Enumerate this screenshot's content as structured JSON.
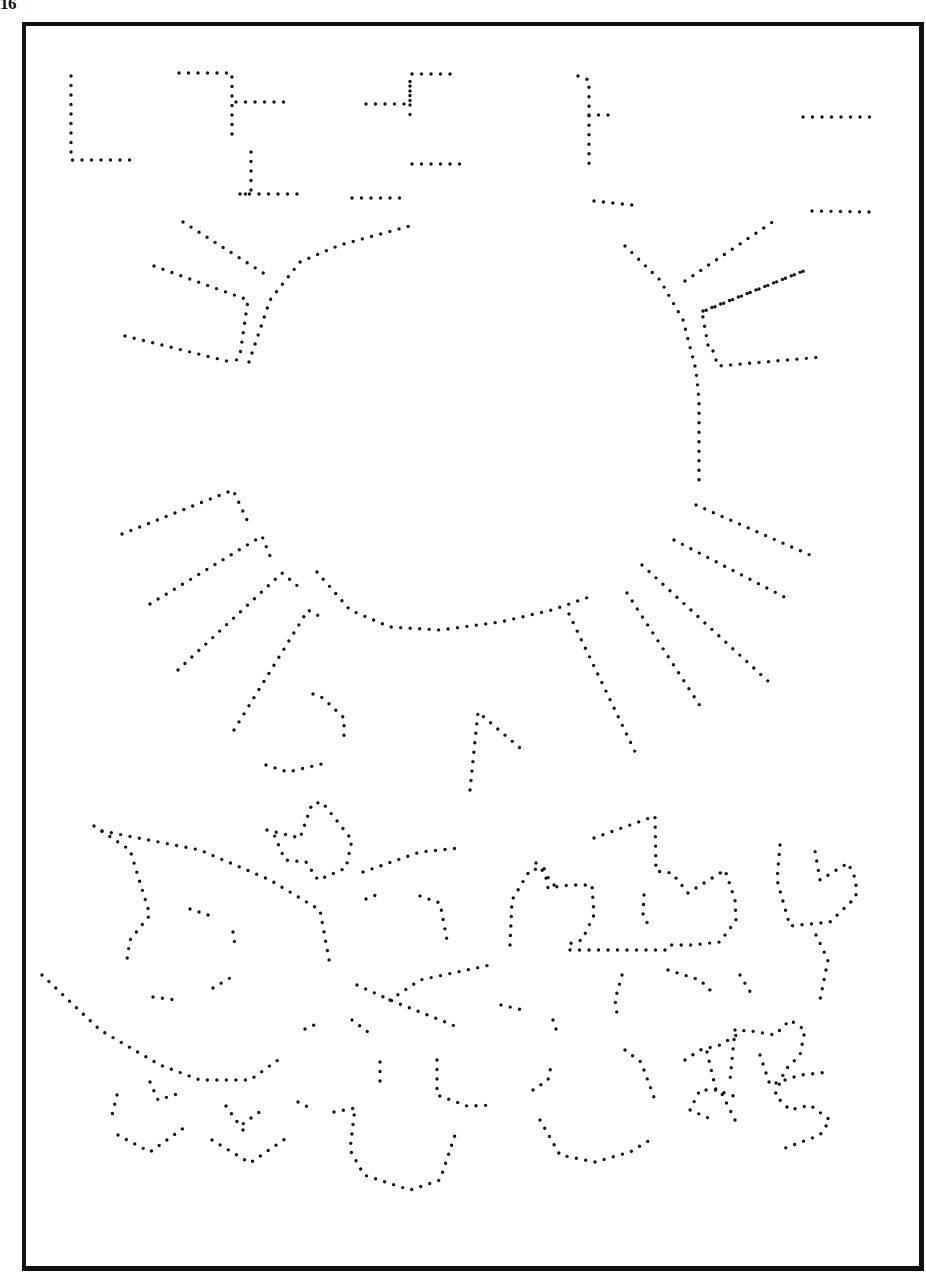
{
  "page": {
    "page_number": "16",
    "ink_color": "#111111",
    "paper_color": "#ffffff"
  },
  "paths": [
    {
      "name": "sky-shape-1",
      "points": [
        [
          71,
          76
        ],
        [
          71,
          160
        ],
        [
          136,
          160
        ]
      ]
    },
    {
      "name": "sky-shape-2",
      "points": [
        [
          179,
          73
        ],
        [
          232,
          73
        ],
        [
          232,
          82
        ],
        [
          232,
          138
        ]
      ]
    },
    {
      "name": "sky-shape-3",
      "points": [
        [
          236,
          102
        ],
        [
          292,
          102
        ]
      ]
    },
    {
      "name": "sky-shape-4",
      "points": [
        [
          251,
          152
        ],
        [
          251,
          194
        ],
        [
          238,
          194
        ],
        [
          298,
          194
        ]
      ]
    },
    {
      "name": "sky-shape-5",
      "points": [
        [
          366,
          104
        ],
        [
          410,
          104
        ],
        [
          410,
          74
        ],
        [
          459,
          74
        ]
      ]
    },
    {
      "name": "sky-shape-6",
      "points": [
        [
          410,
          86
        ],
        [
          410,
          118
        ]
      ]
    },
    {
      "name": "sky-shape-7",
      "points": [
        [
          412,
          164
        ],
        [
          463,
          164
        ]
      ]
    },
    {
      "name": "sky-shape-8",
      "points": [
        [
          352,
          198
        ],
        [
          408,
          198
        ]
      ]
    },
    {
      "name": "sky-shape-9",
      "points": [
        [
          578,
          76
        ],
        [
          589,
          80
        ],
        [
          589,
          166
        ]
      ]
    },
    {
      "name": "sky-shape-10",
      "points": [
        [
          589,
          115
        ],
        [
          613,
          115
        ]
      ]
    },
    {
      "name": "sky-shape-11",
      "points": [
        [
          803,
          117
        ],
        [
          870,
          117
        ]
      ]
    },
    {
      "name": "sky-shape-12",
      "points": [
        [
          594,
          201
        ],
        [
          641,
          206
        ]
      ]
    },
    {
      "name": "sky-shape-13",
      "points": [
        [
          812,
          211
        ],
        [
          869,
          212
        ]
      ]
    },
    {
      "name": "sun-ray-upper-left-1",
      "points": [
        [
          183,
          222
        ],
        [
          268,
          276
        ]
      ]
    },
    {
      "name": "sun-ray-upper-left-2",
      "points": [
        [
          154,
          266
        ],
        [
          248,
          300
        ],
        [
          240,
          355
        ],
        [
          235,
          362
        ]
      ]
    },
    {
      "name": "sun-ray-upper-left-3",
      "points": [
        [
          125,
          336
        ],
        [
          235,
          363
        ]
      ]
    },
    {
      "name": "sun-outline-upper-left",
      "points": [
        [
          249,
          362
        ],
        [
          270,
          300
        ],
        [
          300,
          262
        ],
        [
          340,
          245
        ],
        [
          417,
          224
        ]
      ]
    },
    {
      "name": "sun-outline-right",
      "points": [
        [
          625,
          246
        ],
        [
          660,
          280
        ],
        [
          683,
          320
        ],
        [
          696,
          370
        ],
        [
          699,
          400
        ],
        [
          699,
          480
        ]
      ]
    },
    {
      "name": "sun-ray-upper-right-1",
      "points": [
        [
          685,
          281
        ],
        [
          777,
          219
        ]
      ]
    },
    {
      "name": "sun-ray-upper-right-2",
      "points": [
        [
          703,
          311
        ],
        [
          806,
          270
        ],
        [
          702,
          312
        ],
        [
          708,
          345
        ]
      ]
    },
    {
      "name": "sun-ray-upper-right-3",
      "points": [
        [
          713,
          351
        ],
        [
          718,
          366
        ],
        [
          822,
          357
        ]
      ]
    },
    {
      "name": "sun-ray-right-1",
      "points": [
        [
          696,
          505
        ],
        [
          810,
          555
        ]
      ]
    },
    {
      "name": "sun-ray-right-2",
      "points": [
        [
          674,
          540
        ],
        [
          792,
          601
        ]
      ]
    },
    {
      "name": "sun-ray-right-3",
      "points": [
        [
          642,
          565
        ],
        [
          769,
          682
        ]
      ]
    },
    {
      "name": "sun-ray-lower-right-1",
      "points": [
        [
          627,
          593
        ],
        [
          704,
          712
        ]
      ]
    },
    {
      "name": "sun-ray-lower-right-2",
      "points": [
        [
          569,
          614
        ],
        [
          638,
          758
        ]
      ]
    },
    {
      "name": "sun-outline-bottom",
      "points": [
        [
          317,
          572
        ],
        [
          350,
          610
        ],
        [
          390,
          627
        ],
        [
          440,
          630
        ],
        [
          500,
          622
        ],
        [
          552,
          610
        ],
        [
          589,
          597
        ]
      ]
    },
    {
      "name": "sun-ray-left-1",
      "points": [
        [
          122,
          534
        ],
        [
          233,
          490
        ],
        [
          247,
          520
        ]
      ]
    },
    {
      "name": "sun-ray-left-2",
      "points": [
        [
          150,
          604
        ],
        [
          262,
          536
        ],
        [
          270,
          556
        ]
      ]
    },
    {
      "name": "sun-ray-left-3",
      "points": [
        [
          178,
          670
        ],
        [
          282,
          573
        ],
        [
          300,
          588
        ]
      ]
    },
    {
      "name": "sun-ray-left-4",
      "points": [
        [
          234,
          730
        ],
        [
          308,
          610
        ],
        [
          323,
          618
        ]
      ]
    },
    {
      "name": "hook-shape",
      "points": [
        [
          313,
          694
        ],
        [
          323,
          698
        ],
        [
          344,
          718
        ],
        [
          344,
          740
        ]
      ]
    },
    {
      "name": "hook-shape-bottom",
      "points": [
        [
          266,
          765
        ],
        [
          288,
          772
        ],
        [
          330,
          762
        ]
      ]
    },
    {
      "name": "peak-shape",
      "points": [
        [
          470,
          790
        ],
        [
          478,
          712
        ],
        [
          520,
          748
        ]
      ]
    },
    {
      "name": "flower-left-stem",
      "points": [
        [
          94,
          826
        ],
        [
          130,
          850
        ],
        [
          150,
          915
        ],
        [
          130,
          940
        ],
        [
          126,
          966
        ]
      ]
    },
    {
      "name": "leaf-left-top",
      "points": [
        [
          102,
          831
        ],
        [
          200,
          850
        ],
        [
          270,
          880
        ],
        [
          320,
          910
        ],
        [
          330,
          965
        ]
      ]
    },
    {
      "name": "flower-top-center",
      "points": [
        [
          267,
          830
        ],
        [
          300,
          838
        ],
        [
          312,
          804
        ],
        [
          322,
          802
        ],
        [
          352,
          840
        ],
        [
          346,
          868
        ],
        [
          318,
          880
        ],
        [
          306,
          862
        ],
        [
          285,
          860
        ],
        [
          272,
          830
        ]
      ]
    },
    {
      "name": "leaf-center",
      "points": [
        [
          363,
          872
        ],
        [
          420,
          852
        ],
        [
          460,
          848
        ]
      ]
    },
    {
      "name": "curve-left-1",
      "points": [
        [
          190,
          909
        ],
        [
          214,
          917
        ]
      ]
    },
    {
      "name": "curve-left-2",
      "points": [
        [
          233,
          932
        ],
        [
          235,
          945
        ]
      ]
    },
    {
      "name": "curve-left-3",
      "points": [
        [
          213,
          988
        ],
        [
          235,
          975
        ]
      ]
    },
    {
      "name": "curve-left-4",
      "points": [
        [
          153,
          997
        ],
        [
          176,
          1000
        ]
      ]
    },
    {
      "name": "ground-curve",
      "points": [
        [
          42,
          975
        ],
        [
          100,
          1030
        ],
        [
          160,
          1065
        ],
        [
          200,
          1080
        ],
        [
          250,
          1080
        ],
        [
          278,
          1060
        ]
      ]
    },
    {
      "name": "petals-1",
      "points": [
        [
          150,
          1082
        ],
        [
          158,
          1100
        ],
        [
          177,
          1094
        ]
      ]
    },
    {
      "name": "petals-2",
      "points": [
        [
          117,
          1095
        ],
        [
          112,
          1115
        ]
      ]
    },
    {
      "name": "bowl-left",
      "points": [
        [
          118,
          1135
        ],
        [
          150,
          1152
        ],
        [
          185,
          1127
        ]
      ]
    },
    {
      "name": "bowl-mid",
      "points": [
        [
          212,
          1140
        ],
        [
          250,
          1163
        ],
        [
          288,
          1137
        ]
      ]
    },
    {
      "name": "v-shape",
      "points": [
        [
          226,
          1106
        ],
        [
          240,
          1126
        ],
        [
          265,
          1108
        ]
      ]
    },
    {
      "name": "v-stem",
      "points": [
        [
          243,
          1130
        ],
        [
          245,
          1135
        ]
      ]
    },
    {
      "name": "small-mark-1",
      "points": [
        [
          298,
          1102
        ],
        [
          308,
          1107
        ]
      ]
    },
    {
      "name": "small-mark-2",
      "points": [
        [
          305,
          1029
        ],
        [
          314,
          1025
        ]
      ]
    },
    {
      "name": "mid-curve-1",
      "points": [
        [
          366,
          899
        ],
        [
          381,
          893
        ]
      ]
    },
    {
      "name": "mid-curve-2",
      "points": [
        [
          420,
          896
        ],
        [
          440,
          903
        ],
        [
          447,
          940
        ]
      ]
    },
    {
      "name": "leaf-mid",
      "points": [
        [
          357,
          985
        ],
        [
          390,
          1000
        ],
        [
          460,
          1028
        ]
      ]
    },
    {
      "name": "leaf-mid-stem",
      "points": [
        [
          390,
          1000
        ],
        [
          420,
          980
        ],
        [
          490,
          965
        ]
      ]
    },
    {
      "name": "mid-marks",
      "points": [
        [
          352,
          1020
        ],
        [
          368,
          1032
        ]
      ]
    },
    {
      "name": "bowl-center",
      "points": [
        [
          334,
          1112
        ],
        [
          355,
          1108
        ],
        [
          350,
          1150
        ],
        [
          364,
          1175
        ],
        [
          410,
          1190
        ],
        [
          440,
          1180
        ],
        [
          455,
          1135
        ]
      ]
    },
    {
      "name": "stem-center",
      "points": [
        [
          380,
          1062
        ],
        [
          380,
          1085
        ]
      ]
    },
    {
      "name": "stem-center-2",
      "points": [
        [
          437,
          1060
        ],
        [
          437,
          1095
        ],
        [
          467,
          1106
        ],
        [
          495,
          1105
        ]
      ]
    },
    {
      "name": "tulip-center",
      "points": [
        [
          510,
          945
        ],
        [
          512,
          900
        ],
        [
          530,
          870
        ],
        [
          544,
          868
        ],
        [
          548,
          888
        ],
        [
          570,
          885
        ],
        [
          592,
          885
        ],
        [
          594,
          915
        ],
        [
          582,
          940
        ],
        [
          565,
          945
        ]
      ]
    },
    {
      "name": "tulip-center-2",
      "points": [
        [
          536,
          863
        ],
        [
          542,
          870
        ],
        [
          558,
          890
        ]
      ]
    },
    {
      "name": "stem-flower-row",
      "points": [
        [
          570,
          950
        ],
        [
          668,
          950
        ]
      ]
    },
    {
      "name": "tulip-right-1",
      "points": [
        [
          594,
          838
        ],
        [
          655,
          816
        ],
        [
          656,
          871
        ],
        [
          672,
          873
        ],
        [
          688,
          893
        ],
        [
          725,
          870
        ],
        [
          735,
          900
        ],
        [
          736,
          920
        ],
        [
          720,
          942
        ],
        [
          692,
          945
        ],
        [
          670,
          945
        ]
      ]
    },
    {
      "name": "tulip-right-2",
      "points": [
        [
          644,
          895
        ],
        [
          643,
          915
        ],
        [
          650,
          928
        ]
      ]
    },
    {
      "name": "tulip-far-right",
      "points": [
        [
          780,
          845
        ],
        [
          777,
          880
        ],
        [
          790,
          926
        ],
        [
          830,
          922
        ],
        [
          856,
          897
        ],
        [
          856,
          880
        ],
        [
          848,
          863
        ],
        [
          820,
          880
        ],
        [
          814,
          845
        ]
      ]
    },
    {
      "name": "stem-far-right",
      "points": [
        [
          816,
          935
        ],
        [
          828,
          960
        ],
        [
          820,
          1000
        ]
      ]
    },
    {
      "name": "flower-bottom-right",
      "points": [
        [
          622,
          975
        ],
        [
          615,
          1000
        ],
        [
          618,
          1020
        ]
      ]
    },
    {
      "name": "flower-bottom-right-2",
      "points": [
        [
          668,
          970
        ],
        [
          700,
          980
        ],
        [
          715,
          995
        ]
      ]
    },
    {
      "name": "leaf-right-mid",
      "points": [
        [
          740,
          975
        ],
        [
          752,
          995
        ]
      ]
    },
    {
      "name": "marks-right",
      "points": [
        [
          501,
          1005
        ],
        [
          523,
          1010
        ]
      ]
    },
    {
      "name": "marks-right-2",
      "points": [
        [
          553,
          1020
        ],
        [
          558,
          1035
        ]
      ]
    },
    {
      "name": "curve-bottom-mid",
      "points": [
        [
          533,
          1090
        ],
        [
          548,
          1080
        ],
        [
          552,
          1062
        ]
      ]
    },
    {
      "name": "bowl-bottom-right",
      "points": [
        [
          540,
          1120
        ],
        [
          560,
          1155
        ],
        [
          595,
          1162
        ],
        [
          630,
          1152
        ],
        [
          655,
          1137
        ]
      ]
    },
    {
      "name": "stem-bottom-right",
      "points": [
        [
          625,
          1050
        ],
        [
          641,
          1062
        ],
        [
          655,
          1100
        ]
      ]
    },
    {
      "name": "star-shape",
      "points": [
        [
          685,
          1060
        ],
        [
          700,
          1050
        ],
        [
          720,
          1045
        ],
        [
          745,
          1030
        ],
        [
          775,
          1035
        ],
        [
          790,
          1020
        ],
        [
          805,
          1030
        ],
        [
          800,
          1055
        ],
        [
          785,
          1070
        ],
        [
          775,
          1095
        ],
        [
          790,
          1110
        ],
        [
          810,
          1105
        ],
        [
          830,
          1120
        ],
        [
          820,
          1135
        ],
        [
          780,
          1150
        ]
      ]
    },
    {
      "name": "star-shape-2",
      "points": [
        [
          707,
          1052
        ],
        [
          716,
          1090
        ],
        [
          740,
          1098
        ]
      ]
    },
    {
      "name": "star-shape-3",
      "points": [
        [
          735,
          1030
        ],
        [
          730,
          1080
        ]
      ]
    },
    {
      "name": "star-shape-4",
      "points": [
        [
          760,
          1055
        ],
        [
          770,
          1085
        ],
        [
          800,
          1075
        ],
        [
          830,
          1072
        ]
      ]
    },
    {
      "name": "star-shape-5",
      "points": [
        [
          735,
          1120
        ],
        [
          720,
          1090
        ],
        [
          700,
          1090
        ],
        [
          690,
          1110
        ],
        [
          713,
          1120
        ]
      ]
    }
  ]
}
